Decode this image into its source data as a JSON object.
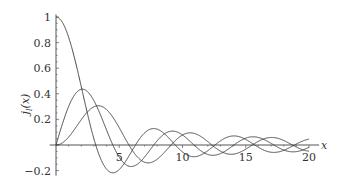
{
  "chart_data": {
    "type": "line",
    "title": "",
    "xlabel": "x",
    "ylabel": "j_l(x)",
    "xlim": [
      0,
      20.5
    ],
    "ylim": [
      -0.22,
      1.02
    ],
    "grid": false,
    "legend": null,
    "x_ticks": [
      5,
      10,
      15,
      20
    ],
    "x_tick_labels": [
      "5",
      "10",
      "15",
      "20"
    ],
    "y_ticks": [
      -0.2,
      0.2,
      0.4,
      0.6,
      0.8,
      1
    ],
    "y_tick_labels": [
      "−0.2",
      "0.2",
      "0.4",
      "0.6",
      "0.8",
      "1"
    ],
    "series": [
      {
        "name": "j0(x)",
        "order": 0,
        "x": [
          0,
          1,
          2,
          3,
          4,
          5,
          6,
          7,
          8,
          9,
          10,
          12,
          14,
          16,
          18,
          20
        ],
        "values": [
          1.0,
          0.841,
          0.455,
          0.047,
          -0.189,
          -0.192,
          -0.047,
          0.094,
          0.124,
          0.046,
          -0.054,
          -0.045,
          0.071,
          -0.018,
          -0.042,
          0.046
        ]
      },
      {
        "name": "j1(x)",
        "order": 1,
        "x": [
          0,
          1,
          2,
          3,
          4,
          5,
          6,
          7,
          8,
          9,
          10,
          12,
          14,
          16,
          18,
          20
        ],
        "values": [
          0.0,
          0.301,
          0.435,
          0.346,
          0.116,
          -0.095,
          -0.167,
          -0.095,
          0.034,
          0.112,
          0.078,
          -0.062,
          -0.025,
          0.061,
          -0.027,
          -0.031
        ]
      },
      {
        "name": "j2(x)",
        "order": 2,
        "x": [
          0,
          1,
          2,
          3,
          4,
          5,
          6,
          7,
          8,
          9,
          10,
          12,
          14,
          16,
          18,
          20
        ],
        "values": [
          0.0,
          0.062,
          0.198,
          0.299,
          0.276,
          0.135,
          -0.037,
          -0.154,
          -0.142,
          -0.033,
          0.078,
          0.061,
          -0.066,
          0.003,
          0.047,
          -0.035
        ]
      }
    ]
  },
  "plot": {
    "origin_px": [
      56,
      145
    ],
    "px_per_x": 12.65,
    "px_per_y": 128,
    "line_color": "#333333",
    "axis_color": "#555555"
  }
}
